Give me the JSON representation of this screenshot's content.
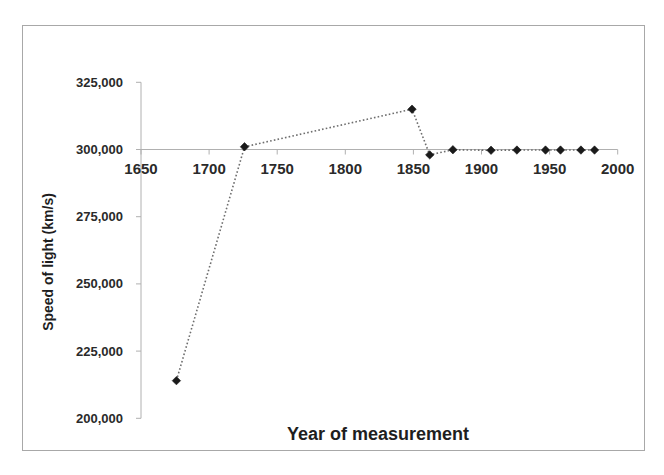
{
  "chart_data": {
    "type": "scatter",
    "title": "",
    "xlabel": "Year of measurement",
    "ylabel": "Speed of light (km/s)",
    "xlim": [
      1650,
      2000
    ],
    "ylim": [
      200000,
      325000
    ],
    "x_ticks": [
      1650,
      1700,
      1750,
      1800,
      1850,
      1900,
      1950,
      2000
    ],
    "x_tick_labels": [
      "1650",
      "1700",
      "1750",
      "1800",
      "1850",
      "1900",
      "1950",
      "2000"
    ],
    "y_ticks": [
      200000,
      225000,
      250000,
      275000,
      300000,
      325000
    ],
    "y_tick_labels": [
      "200,000",
      "225,000",
      "250,000",
      "275,000",
      "300,000",
      "325,000"
    ],
    "x_axis_crosses_at": 300000,
    "grid": false,
    "legend": null,
    "marker": "diamond",
    "line_style": "dotted",
    "series": [
      {
        "name": "Speed of light measurements",
        "x": [
          1676,
          1726,
          1849,
          1862,
          1879,
          1907,
          1926,
          1947,
          1958,
          1973,
          1983
        ],
        "values": [
          214000,
          301000,
          315000,
          298000,
          299910,
          299710,
          299796,
          299792,
          299792.5,
          299792.457,
          299792.458
        ]
      }
    ]
  },
  "colors": {
    "marker": "#1a1a1a",
    "line": "#6e6e6e",
    "axis": "#b0b0b0",
    "frame": "#a8a8a8",
    "text": "#2a2a2a"
  }
}
